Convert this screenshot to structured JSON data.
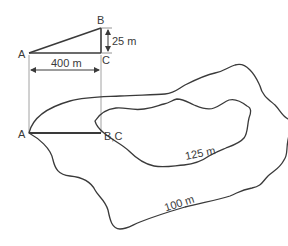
{
  "triangle": {
    "point_a": "A",
    "point_b": "B",
    "point_c": "C",
    "height_label": "25 m",
    "base_label": "400 m"
  },
  "map": {
    "point_a": "A",
    "point_bc": "B,C"
  },
  "contours": [
    {
      "label": "100 m",
      "value": 100
    },
    {
      "label": "125 m",
      "value": 125
    }
  ],
  "colors": {
    "line": "#3a3a3a",
    "thin_line": "#7a7a7a"
  }
}
